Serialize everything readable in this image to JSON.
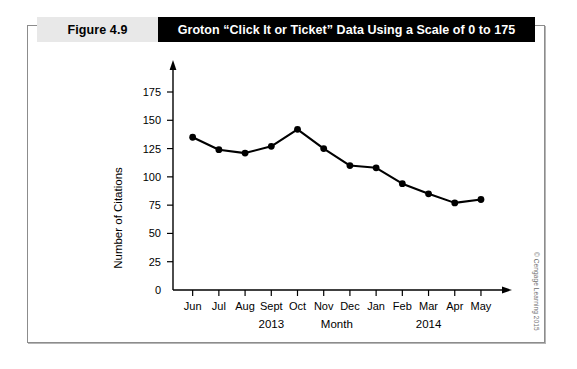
{
  "figure": {
    "label": "Figure 4.9",
    "title": "Groton “Click It or Ticket” Data Using a Scale of 0 to 175",
    "credit": "© Cengage Learning 2015"
  },
  "chart_data": {
    "type": "line",
    "title": "Groton “Click It or Ticket” Data Using a Scale of 0 to 175",
    "categories": [
      "Jun",
      "Jul",
      "Aug",
      "Sept",
      "Oct",
      "Nov",
      "Dec",
      "Jan",
      "Feb",
      "Mar",
      "Apr",
      "May"
    ],
    "values": [
      135,
      124,
      121,
      127,
      142,
      125,
      110,
      108,
      94,
      85,
      77,
      80
    ],
    "xlabel": "Month",
    "ylabel": "Number of Citations",
    "ylim": [
      0,
      175
    ],
    "yticks": [
      0,
      25,
      50,
      75,
      100,
      125,
      150,
      175
    ],
    "ytick_labels": [
      "0",
      "25",
      "50",
      "75",
      "100",
      "125",
      "150",
      "175"
    ],
    "grid": false,
    "legend": null,
    "marker": "filled-circle",
    "line_color": "#000000",
    "marker_color": "#000000",
    "group_labels": [
      {
        "text": "2013",
        "span": [
          "Jun",
          "Dec"
        ]
      },
      {
        "text": "Month",
        "span": [
          "Nov",
          "Dec"
        ]
      },
      {
        "text": "2014",
        "span": [
          "Jan",
          "May"
        ]
      }
    ]
  }
}
